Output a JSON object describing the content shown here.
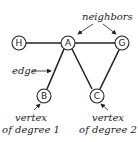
{
  "nodes": {
    "H": {
      "label": "H"
    },
    "A": {
      "label": "A"
    },
    "G": {
      "label": "G"
    },
    "B": {
      "label": "B"
    },
    "C": {
      "label": "C"
    }
  },
  "edges": [
    [
      "H",
      "A"
    ],
    [
      "A",
      "G"
    ],
    [
      "A",
      "B"
    ],
    [
      "A",
      "C"
    ],
    [
      "G",
      "C"
    ]
  ],
  "annotations": {
    "neighbors": "neighbors",
    "edge": "edge",
    "deg1_line1": "vertex",
    "deg1_line2": "of degree 1",
    "deg2_line1": "vertex",
    "deg2_line2": "of degree 2"
  }
}
